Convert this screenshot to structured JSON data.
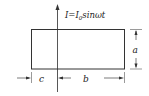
{
  "diagram": {
    "current_label": {
      "prefix": "I=I",
      "subscript": "0",
      "suffix": "sinωt"
    },
    "dimensions": {
      "height_label": "a",
      "width_label": "b",
      "offset_label": "c"
    },
    "colors": {
      "line": "#333333",
      "background": "#ffffff"
    }
  }
}
